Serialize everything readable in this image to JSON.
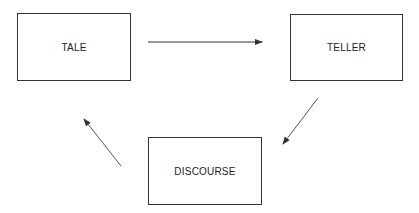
{
  "diagram": {
    "type": "cycle",
    "nodes": [
      {
        "id": "tale",
        "label": "TALE"
      },
      {
        "id": "teller",
        "label": "TELLER"
      },
      {
        "id": "discourse",
        "label": "DISCOURSE"
      }
    ],
    "edges": [
      {
        "from": "tale",
        "to": "teller"
      },
      {
        "from": "teller",
        "to": "discourse"
      },
      {
        "from": "discourse",
        "to": "tale"
      }
    ],
    "colors": {
      "stroke": "#333333",
      "background": "#ffffff",
      "text": "#222222"
    }
  }
}
